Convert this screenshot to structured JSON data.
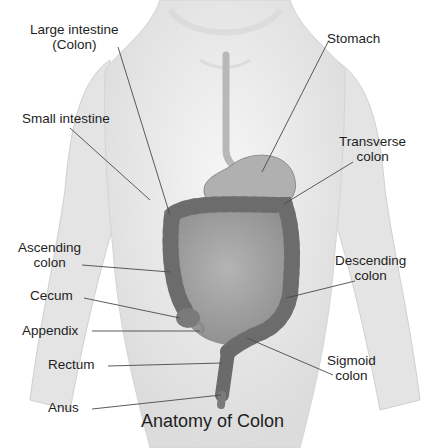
{
  "title": "Anatomy of Colon",
  "labels": {
    "large_intestine": {
      "line1": "Large intestine",
      "line2": "(Colon)"
    },
    "stomach": "Stomach",
    "small_intestine": "Small intestine",
    "transverse_colon": {
      "line1": "Transverse",
      "line2": "colon"
    },
    "ascending_colon": {
      "line1": "Ascending",
      "line2": "colon"
    },
    "descending_colon": {
      "line1": "Descending",
      "line2": "colon"
    },
    "cecum": "Cecum",
    "appendix": "Appendix",
    "rectum": "Rectum",
    "sigmoid_colon": {
      "line1": "Sigmoid",
      "line2": "colon"
    },
    "anus": "Anus"
  },
  "colors": {
    "body": "#ebebeb",
    "body_shadow": "#d2d2d2",
    "organ_light": "#a4a4a4",
    "organ_dark": "#6a6a6a",
    "leader_line": "#4a4a4a",
    "text": "#1e1e1e"
  }
}
